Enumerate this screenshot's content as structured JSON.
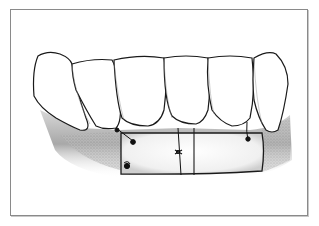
{
  "figure": {
    "description": "Dental illustration: labial view of lower anterior teeth with a free gingival graft sutured below the gingival margin",
    "elements": {
      "teeth_count": 6,
      "graft": "rectangular soft-tissue graft",
      "sutures": 5
    },
    "colors": {
      "frame": "#8a8a8a",
      "outline": "#1a1a1a",
      "gingiva_shade": "#9a9a9a",
      "tooth_fill": "#ffffff"
    }
  }
}
